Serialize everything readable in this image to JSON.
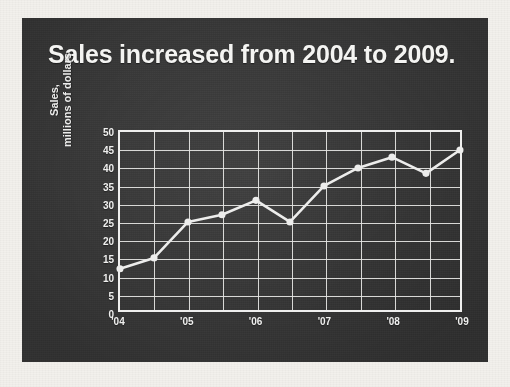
{
  "slide": {
    "title": "Sales increased from 2004 to 2009.",
    "panel_color": "#3b3b3b",
    "page_color": "#f2f0ec",
    "ink_color": "#efefee"
  },
  "chart_data": {
    "type": "line",
    "title": "Sales increased from 2004 to 2009.",
    "xlabel": "",
    "ylabel": "Sales,\nmillions of dollars",
    "ylabel_lines": [
      "Sales,",
      "millions of dollars"
    ],
    "ylim": [
      0,
      50
    ],
    "yticks": [
      50,
      45,
      40,
      35,
      30,
      25,
      20,
      15,
      10,
      5,
      0
    ],
    "xticks": [
      "'04",
      "",
      "'05",
      "",
      "'06",
      "",
      "'07",
      "",
      "'08",
      "",
      "'09"
    ],
    "tick_labels_shown": [
      "'04",
      "'05",
      "'06",
      "'07",
      "'08",
      "'09"
    ],
    "x": [
      0,
      1,
      2,
      3,
      4,
      5,
      6,
      7,
      8,
      9,
      10
    ],
    "values": [
      12,
      15,
      25,
      27,
      31,
      25,
      35,
      40,
      43,
      38.5,
      45
    ],
    "points": [
      {
        "x": "'04",
        "y": 12
      },
      {
        "x": "",
        "y": 15
      },
      {
        "x": "'05",
        "y": 25
      },
      {
        "x": "",
        "y": 27
      },
      {
        "x": "'06",
        "y": 31
      },
      {
        "x": "",
        "y": 25
      },
      {
        "x": "'07",
        "y": 35
      },
      {
        "x": "",
        "y": 40
      },
      {
        "x": "'08",
        "y": 43
      },
      {
        "x": "",
        "y": 38.5
      },
      {
        "x": "'09",
        "y": 45
      }
    ],
    "series": [
      {
        "name": "Sales",
        "values": [
          12,
          15,
          25,
          27,
          31,
          25,
          35,
          40,
          43,
          38.5,
          45
        ],
        "color": "#ededec",
        "marker": "circle"
      }
    ],
    "grid": true,
    "grid_color": "#e6e6e4",
    "legend": false,
    "legend_position": "none"
  }
}
